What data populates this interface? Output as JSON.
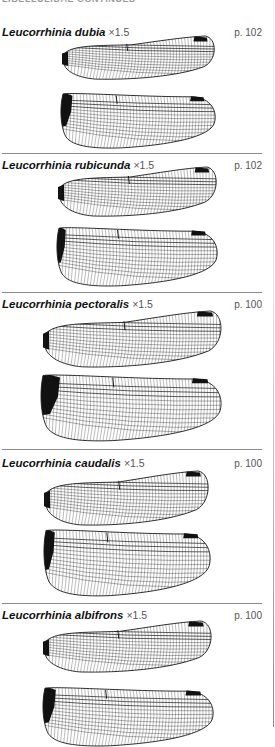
{
  "running_head": "LIBELLULIDAE continued",
  "colors": {
    "vein": "#1a1a1a",
    "stigma": "#111111",
    "divider": "#8c8c8c",
    "text": "#111111",
    "muted": "#555555"
  },
  "sections": [
    {
      "name": "Leucorrhinia dubia",
      "scale": "×1.5",
      "page": "p. 102",
      "top": 26,
      "divider_y": 153,
      "forewing": {
        "x": 62,
        "y": 36,
        "w": 154,
        "h": 44,
        "node": 0.42
      },
      "hindwing": {
        "x": 60,
        "y": 91,
        "w": 156,
        "h": 58,
        "node": 0.36,
        "dark_base": 0.08
      }
    },
    {
      "name": "Leucorrhinia rubicunda",
      "scale": "×1.5",
      "page": "p. 102",
      "top": 159,
      "divider_y": 292,
      "forewing": {
        "x": 58,
        "y": 167,
        "w": 160,
        "h": 50,
        "node": 0.44
      },
      "hindwing": {
        "x": 56,
        "y": 225,
        "w": 162,
        "h": 62,
        "node": 0.38,
        "dark_base": 0.06
      }
    },
    {
      "name": "Leucorrhinia pectoralis",
      "scale": "×1.5",
      "page": "p. 100",
      "top": 298,
      "divider_y": 449,
      "forewing": {
        "x": 43,
        "y": 311,
        "w": 180,
        "h": 57,
        "node": 0.45
      },
      "hindwing": {
        "x": 40,
        "y": 372,
        "w": 182,
        "h": 70,
        "node": 0.4,
        "dark_base": 0.11
      }
    },
    {
      "name": "Leucorrhinia caudalis",
      "scale": "×1.5",
      "page": "p. 100",
      "top": 457,
      "divider_y": 603,
      "forewing": {
        "x": 44,
        "y": 471,
        "w": 166,
        "h": 55,
        "node": 0.45
      },
      "hindwing": {
        "x": 43,
        "y": 527,
        "w": 168,
        "h": 70,
        "node": 0.38,
        "dark_base": 0.07
      }
    },
    {
      "name": "Leucorrhinia albifrons",
      "scale": "×1.5",
      "page": "p. 100",
      "top": 609,
      "divider_y": null,
      "forewing": {
        "x": 43,
        "y": 621,
        "w": 170,
        "h": 52,
        "node": 0.44
      },
      "hindwing": {
        "x": 42,
        "y": 685,
        "w": 172,
        "h": 62,
        "node": 0.37,
        "dark_base": 0.08
      }
    }
  ]
}
